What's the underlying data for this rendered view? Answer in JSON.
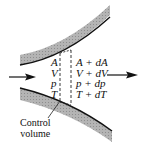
{
  "diagram": {
    "type": "nozzle-control-volume",
    "inlet_labels": [
      "A",
      "V",
      "p",
      "T"
    ],
    "outlet_labels": [
      "A + dA",
      "V + dV",
      "p + dp",
      "T + dT"
    ],
    "control_volume_label": [
      "Control",
      "volume"
    ],
    "flow_direction": "left-to-right",
    "colors": {
      "wall_fill": "#a8a8a8",
      "wall_edge": "#111111",
      "arrow": "#111111",
      "dashes": "#222222"
    }
  }
}
